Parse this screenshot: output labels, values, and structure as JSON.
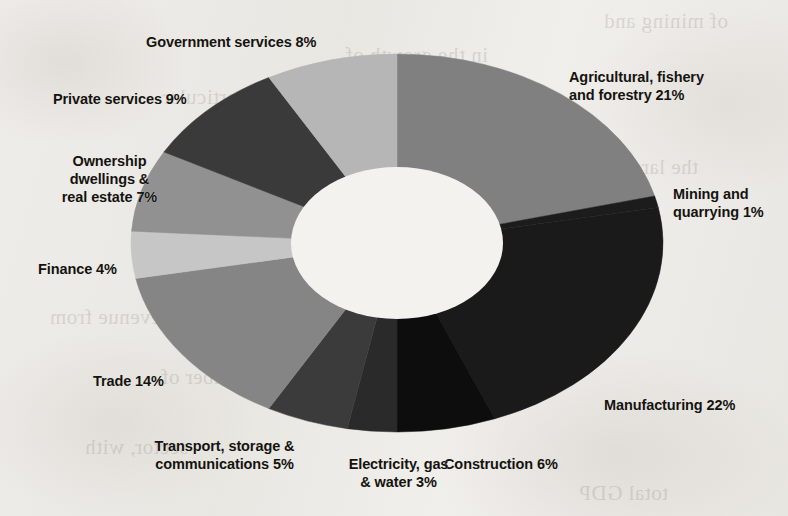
{
  "document": {
    "kind": "scanned-page-figure",
    "background_color": "#eeece8",
    "bleed_through_lines": [
      "of mining and",
      "in the growth of",
      "and in particular",
      "the largest",
      "increased",
      "revenue from",
      "a number of",
      "sector, with",
      "total GDP"
    ]
  },
  "chart_data": {
    "type": "pie",
    "variant": "donut",
    "title": "",
    "subtitle": "",
    "xlabel": "",
    "ylabel": "",
    "legend_position": "outside-labels",
    "grid": false,
    "value_unit": "%",
    "total": 100,
    "start_angle_deg": 0,
    "direction": "clockwise",
    "center": {
      "x": 397,
      "y": 243
    },
    "radius_x": 266,
    "radius_y": 189,
    "inner_radius_x": 106,
    "inner_radius_y": 76,
    "hole_color": "#f4f2ef",
    "categories": [
      "Agricultural, fishery and forestry",
      "Mining and quarrying",
      "Manufacturing",
      "Construction",
      "Electricity, gas & water",
      "Transport, storage & communications",
      "Trade",
      "Finance",
      "Ownership dwellings & real estate",
      "Private services",
      "Government services"
    ],
    "values": [
      21,
      1,
      22,
      6,
      3,
      5,
      14,
      4,
      7,
      9,
      8
    ],
    "slices": [
      {
        "name": "Agricultural, fishery and forestry",
        "label": "Agricultural, fishery\nand forestry 21%",
        "value": 21,
        "color": "#808080",
        "label_x": 569,
        "label_y": 68,
        "align": "lbl-right"
      },
      {
        "name": "Mining and quarrying",
        "label": "Mining and\nquarrying 1%",
        "value": 1,
        "color": "#1c1c1c",
        "label_x": 673,
        "label_y": 185,
        "align": "lbl-right"
      },
      {
        "name": "Manufacturing",
        "label": "Manufacturing 22%",
        "value": 22,
        "color": "#1a1a1a",
        "label_x": 604,
        "label_y": 396,
        "align": "lbl-right"
      },
      {
        "name": "Construction",
        "label": "Construction 6%",
        "value": 6,
        "color": "#0d0d0d",
        "label_x": 444,
        "label_y": 455,
        "align": "lbl-right"
      },
      {
        "name": "Electricity, gas & water",
        "label": "Electricity, gas\n& water 3%",
        "value": 3,
        "color": "#2a2a2a",
        "label_x": 311,
        "label_y": 455,
        "align": "lbl-center"
      },
      {
        "name": "Transport, storage & communications",
        "label": "Transport, storage &\ncommunications 5%",
        "value": 5,
        "color": "#3b3b3b",
        "label_x": 137,
        "label_y": 437,
        "align": "lbl-center"
      },
      {
        "name": "Trade",
        "label": "Trade 14%",
        "value": 14,
        "color": "#858585",
        "label_x": 93,
        "label_y": 372,
        "align": "lbl-right"
      },
      {
        "name": "Finance",
        "label": "Finance 4%",
        "value": 4,
        "color": "#c6c6c6",
        "label_x": 38,
        "label_y": 260,
        "align": "lbl-right"
      },
      {
        "name": "Ownership dwellings & real estate",
        "label": "Ownership\ndwellings &\nreal estate 7%",
        "value": 7,
        "color": "#919191",
        "label_x": 22,
        "label_y": 152,
        "align": "lbl-center"
      },
      {
        "name": "Private services",
        "label": "Private services 9%",
        "value": 9,
        "color": "#3a3a3a",
        "label_x": 53,
        "label_y": 90,
        "align": "lbl-right"
      },
      {
        "name": "Government services",
        "label": "Government services 8%",
        "value": 8,
        "color": "#b6b6b6",
        "label_x": 146,
        "label_y": 33,
        "align": "lbl-right"
      }
    ]
  }
}
